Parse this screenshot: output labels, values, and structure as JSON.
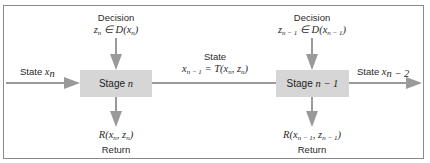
{
  "diagram": {
    "colors": {
      "box_fill": "#d6d6d6",
      "arrow": "#9a9a9a",
      "frame": "#8a8a8a",
      "text": "#2a2a2a"
    },
    "input_state": {
      "label": "State",
      "var": "x",
      "sub": "n"
    },
    "stages": [
      {
        "label": "Stage",
        "index": "n",
        "decision": {
          "title": "Decision",
          "z": "z",
          "z_sub": "n",
          "rel": "∈ D(x",
          "x_sub": "n",
          "close": ")"
        },
        "return": {
          "title": "Return",
          "R": "R(x",
          "x_sub": "n",
          "comma": ", z",
          "z_sub": "n",
          "close": ")"
        }
      },
      {
        "label": "Stage",
        "index": "n − 1",
        "decision": {
          "title": "Decision",
          "z": "z",
          "z_sub": "n − 1",
          "rel": "∈ D(x",
          "x_sub": "n − 1",
          "close": ")"
        },
        "return": {
          "title": "Return",
          "R": "R(x",
          "x_sub": "n − 1",
          "comma": ", z",
          "z_sub": "n − 1",
          "close": ")"
        }
      }
    ],
    "transition": {
      "title": "State",
      "lhs": "x",
      "lhs_sub": "n − 1",
      "eq": " = T(x",
      "x_sub": "n",
      "comma": ", z",
      "z_sub": "n",
      "close": ")"
    },
    "output_state": {
      "label": "State",
      "var": "x",
      "sub": "n − 2"
    }
  }
}
